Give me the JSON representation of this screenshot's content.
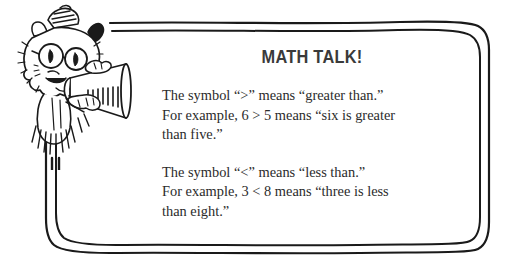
{
  "callout": {
    "title": "MATH TALK!",
    "paragraphs": [
      {
        "lines": [
          "The symbol “>” means “greater than.”",
          "For example, 6 > 5 means “six is greater",
          "than five.”"
        ]
      },
      {
        "lines": [
          "The symbol “<” means “less than.”",
          "For example, 3 < 8 means “three is less",
          "than eight.”"
        ]
      }
    ]
  },
  "illustration": {
    "name": "cartoon-cat-with-megaphone",
    "description": "Shaggy cartoon cat wearing round eyeglasses and a cap, shouting through a megaphone"
  },
  "colors": {
    "ink": "#2b2b2b",
    "title_ink": "#3a3a3a",
    "background": "#ffffff",
    "border": "#1a1a1a"
  }
}
